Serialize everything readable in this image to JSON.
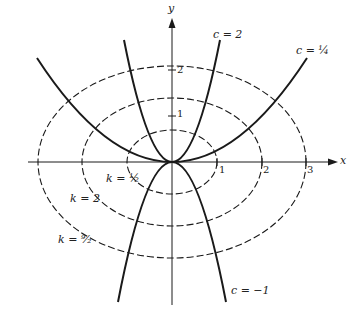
{
  "figure": {
    "axes": {
      "x_label": "x",
      "y_label": "y"
    },
    "x_ticks": [
      "1",
      "2",
      "3"
    ],
    "y_ticks": [
      "1",
      "2"
    ],
    "curves": {
      "parabolas": [
        {
          "label": "c = 2",
          "c": "2"
        },
        {
          "label": "c = 1/4",
          "c": "1/4"
        },
        {
          "label": "c = −1",
          "c": "−1"
        }
      ],
      "ellipses": [
        {
          "label": "k = 1/2",
          "k": "1/2"
        },
        {
          "label": "k = 2",
          "k": "2"
        },
        {
          "label": "k = 9/2",
          "k": "9/2"
        }
      ]
    },
    "labels": {
      "c2": "c = 2",
      "c14": "c = ¼",
      "cm1": "c = −1",
      "k12": "k = ½",
      "k2": "k = 2",
      "k92": "k = ⁹⁄₂"
    },
    "colors": {
      "ink": "#1a1a1a",
      "background": "#ffffff"
    }
  }
}
